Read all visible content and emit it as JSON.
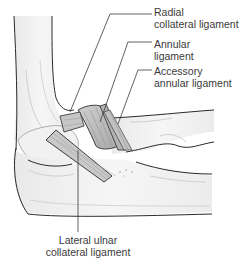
{
  "figure": {
    "labels": {
      "radial_collateral": [
        "Radial",
        "collateral ligament"
      ],
      "annular": [
        "Annular",
        "ligament"
      ],
      "accessory_annular": [
        "Accessory",
        "annular ligament"
      ],
      "lateral_ulnar_collateral": [
        "Lateral ulnar",
        "collateral ligament"
      ]
    },
    "colors": {
      "outline": "#2b2b2b",
      "bone_fill": "#f3f3f3",
      "ligament_fill": "#bdbdbd",
      "ligament_dark": "#a6a6a6",
      "leader_line": "#3a3a3a",
      "text": "#3a3a3a"
    }
  }
}
